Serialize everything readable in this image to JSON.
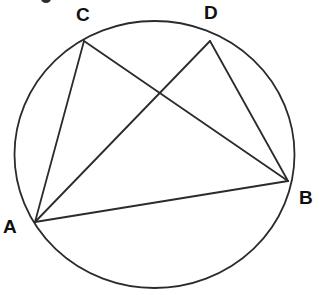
{
  "diagram": {
    "kind": "circle-geometry-diagram",
    "background_color": "#ffffff",
    "stroke_color": "#2b2b2b",
    "label_color": "#101010",
    "canvas": {
      "width": 319,
      "height": 295
    },
    "circle": {
      "name": "circumference",
      "center_x": 154.5,
      "center_y": 154.5,
      "radius_x": 140,
      "radius_y": 133.5,
      "stroke_width": 1.8
    },
    "points": [
      {
        "id": "A",
        "label": "A",
        "x": 35,
        "y": 222
      },
      {
        "id": "B",
        "label": "B",
        "x": 288,
        "y": 181
      },
      {
        "id": "C",
        "label": "C",
        "x": 84,
        "y": 41
      },
      {
        "id": "D",
        "label": "D",
        "x": 210,
        "y": 41
      }
    ],
    "chords": [
      {
        "id": "AC",
        "from": "A",
        "to": "C",
        "x1": 35,
        "y1": 222,
        "x2": 84,
        "y2": 41
      },
      {
        "id": "AD",
        "from": "A",
        "to": "D",
        "x1": 35,
        "y1": 222,
        "x2": 210,
        "y2": 41
      },
      {
        "id": "CB",
        "from": "C",
        "to": "B",
        "x1": 84,
        "y1": 41,
        "x2": 288,
        "y2": 181
      },
      {
        "id": "DB",
        "from": "D",
        "to": "B",
        "x1": 210,
        "y1": 41,
        "x2": 288,
        "y2": 181
      },
      {
        "id": "AB",
        "from": "A",
        "to": "B",
        "x1": 35,
        "y1": 222,
        "x2": 288,
        "y2": 181
      }
    ],
    "intersection": {
      "id": "AD-CB",
      "x": 160,
      "y": 93
    },
    "stroke_width": 1.8
  }
}
